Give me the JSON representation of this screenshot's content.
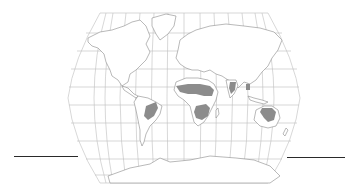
{
  "map": {
    "projection": "robinson",
    "style": {
      "background": "#ffffff",
      "graticule_color": "#b8b8b8",
      "coast_color": "#8a8a8a",
      "land_fill": "#ffffff",
      "savanna_fill": "#8c8c8c",
      "rule_color": "#2a2a2a"
    },
    "graticule": {
      "meridian_step_deg": 15,
      "parallel_step_deg": 15
    },
    "highlighted_regions": [
      {
        "name": "africa-sahel-sudan",
        "label": ""
      },
      {
        "name": "africa-southern",
        "label": ""
      },
      {
        "name": "south-america-cerrado",
        "label": ""
      },
      {
        "name": "india",
        "label": ""
      },
      {
        "name": "southeast-asia",
        "label": ""
      },
      {
        "name": "northern-australia",
        "label": ""
      }
    ],
    "legend": [],
    "title": ""
  },
  "rules": [
    {
      "name": "left-rule",
      "x1": 14,
      "x2": 78,
      "y": 156
    },
    {
      "name": "right-rule",
      "x1": 287,
      "x2": 345,
      "y": 157
    }
  ]
}
